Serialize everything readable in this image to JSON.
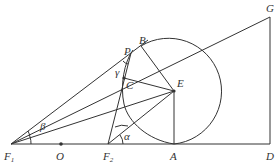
{
  "diagram": {
    "type": "geometry",
    "points": {
      "F1": {
        "label": "F",
        "sub": "1",
        "x": 11,
        "y": 144
      },
      "O": {
        "label": "O",
        "x": 61,
        "y": 144
      },
      "F2": {
        "label": "F",
        "sub": "2",
        "x": 108,
        "y": 144
      },
      "A": {
        "label": "A",
        "x": 174,
        "y": 144
      },
      "D": {
        "label": "D",
        "x": 270,
        "y": 144
      },
      "G": {
        "label": "G",
        "x": 270,
        "y": 17
      },
      "E": {
        "label": "E",
        "x": 174,
        "y": 91
      },
      "B": {
        "label": "B",
        "x": 141,
        "y": 46
      },
      "P": {
        "label": "P",
        "x": 131,
        "y": 53
      },
      "C": {
        "label": "C",
        "x": 124,
        "y": 78
      }
    },
    "angles": {
      "alpha": "α",
      "beta": "β",
      "gamma": "γ"
    },
    "circle": {
      "center": "E",
      "radius": 53
    }
  }
}
